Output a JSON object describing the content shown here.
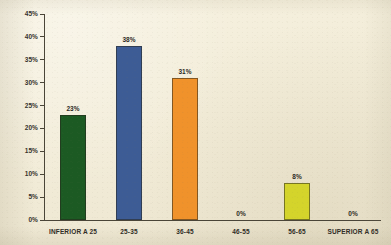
{
  "chart_data": {
    "type": "bar",
    "title": "",
    "subtitle": "",
    "xlabel": "",
    "ylabel": "",
    "categories": [
      "INFERIOR A 25",
      "25-35",
      "36-45",
      "46-55",
      "56-65",
      "SUPERIOR A 65"
    ],
    "values": [
      23,
      38,
      31,
      0,
      8,
      0
    ],
    "data_labels": [
      "23%",
      "38%",
      "31%",
      "0%",
      "8%",
      "0%"
    ],
    "bar_colors": [
      "#1c5a23",
      "#3d5c95",
      "#f0922b",
      "#f0922b",
      "#d4d42b",
      "#d4d42b"
    ],
    "ylim": [
      0,
      45
    ],
    "ytick_values": [
      0,
      5,
      10,
      15,
      20,
      25,
      30,
      35,
      40,
      45
    ],
    "ytick_labels": [
      "0%",
      "5%",
      "10%",
      "15%",
      "20%",
      "25%",
      "30%",
      "35%",
      "40%",
      "45%"
    ],
    "grid": false,
    "legend": "none",
    "legend_entries": [],
    "annotations": []
  },
  "style": {
    "background_color": "#f2ecd8",
    "axis_color": "#4a4538",
    "text_color": "#2e2b25"
  }
}
